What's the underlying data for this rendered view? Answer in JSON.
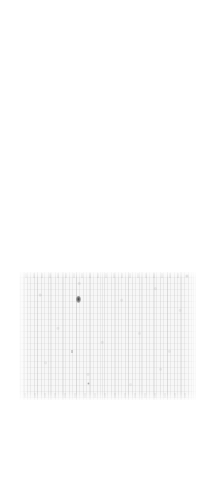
{
  "canvas": {
    "width": 212,
    "height": 492,
    "background_color": "#ffffff"
  },
  "document_scan": {
    "label": "faded-scanned-document",
    "description": "Heavily degraded, near-illegible scanned page region",
    "paper_color": "#f7f7f7",
    "ink_color": "#8c8c8c",
    "smudge_color": "#2a2a2a",
    "bounds": {
      "left": 19,
      "top": 272,
      "width": 177,
      "height": 128
    },
    "legible_text": "",
    "ghost_text": "",
    "artifacts": [
      {
        "name": "ink-smudge",
        "x": 57,
        "y": 24,
        "w": 5,
        "h": 7
      },
      {
        "name": "ink-speck-a",
        "x": 68,
        "y": 110,
        "w": 3,
        "h": 3
      },
      {
        "name": "ink-speck-b",
        "x": 166,
        "y": 2,
        "w": 4,
        "h": 4
      },
      {
        "name": "ink-speck-c",
        "x": 52,
        "y": 78,
        "w": 2,
        "h": 3
      }
    ]
  }
}
